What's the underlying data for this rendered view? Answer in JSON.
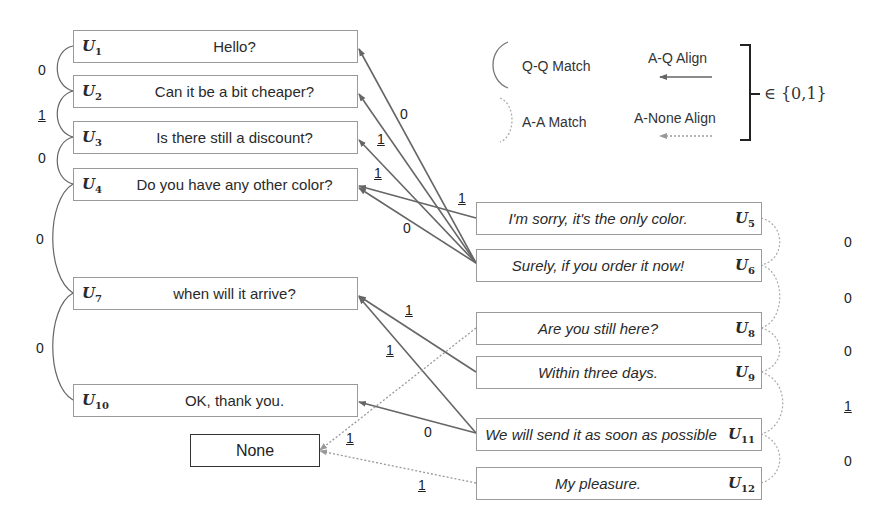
{
  "legend": {
    "qq_match": "Q-Q Match",
    "aq_align": "A-Q Align",
    "aa_match": "A-A Match",
    "anone_align": "A-None Align",
    "set_label": "∈ {0,1}"
  },
  "questions": [
    {
      "id": "U",
      "sub": "1",
      "text": "Hello?"
    },
    {
      "id": "U",
      "sub": "2",
      "text": "Can it be a bit cheaper?"
    },
    {
      "id": "U",
      "sub": "3",
      "text": "Is there still a discount?"
    },
    {
      "id": "U",
      "sub": "4",
      "text": "Do you have any other color?"
    },
    {
      "id": "U",
      "sub": "7",
      "text": "when will it arrive?"
    },
    {
      "id": "U",
      "sub": "10",
      "text": "OK, thank you."
    }
  ],
  "answers": [
    {
      "id": "U",
      "sub": "5",
      "text": "I'm sorry, it's the only color."
    },
    {
      "id": "U",
      "sub": "6",
      "text": "Surely, if you order it now!"
    },
    {
      "id": "U",
      "sub": "8",
      "text": "Are you still here?"
    },
    {
      "id": "U",
      "sub": "9",
      "text": "Within three days."
    },
    {
      "id": "U",
      "sub": "11",
      "text": "We will send it as soon as possible"
    },
    {
      "id": "U",
      "sub": "12",
      "text": "My pleasure."
    }
  ],
  "none_box": "None",
  "qq_labels": [
    "0",
    "1",
    "0",
    "0",
    "0"
  ],
  "aa_labels": [
    "0",
    "0",
    "0",
    "1",
    "0"
  ],
  "aq_labels": {
    "u6_u1": "0",
    "u6_u2": "1",
    "u6_u3": "1",
    "u5_u4": "1",
    "u6_u4": "0",
    "u9_u7": "1",
    "u11_u7": "1",
    "u11_u10": "0",
    "u8_none": "1",
    "u12_none": "1"
  }
}
